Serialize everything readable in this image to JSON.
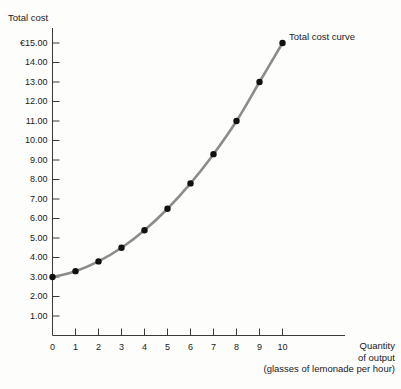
{
  "chart_data": {
    "type": "line",
    "title": "",
    "subtitle": "",
    "ylabel": "Total cost",
    "xlabel": "Quantity of output (glasses of lemonade per hour)",
    "xlabel_lines": [
      "Quantity",
      "of output",
      "(glasses of lemonade per hour)"
    ],
    "currency_symbol": "€",
    "x": [
      0,
      1,
      2,
      3,
      4,
      5,
      6,
      7,
      8,
      9,
      10
    ],
    "xlim": [
      0,
      10.6
    ],
    "ylim": [
      0,
      15.6
    ],
    "grid": false,
    "legend_position": "inline-right-of-last-point",
    "series": [
      {
        "name": "Total cost curve",
        "color": "#8c8c8c",
        "marker_color": "#111111",
        "values": [
          3.0,
          3.3,
          3.8,
          4.5,
          5.4,
          6.5,
          7.8,
          9.3,
          11.0,
          13.0,
          15.0
        ]
      }
    ],
    "xticks": [
      0,
      1,
      2,
      3,
      4,
      5,
      6,
      7,
      8,
      9,
      10
    ],
    "xtick_labels": [
      "0",
      "1",
      "2",
      "3",
      "4",
      "5",
      "6",
      "7",
      "8",
      "9",
      "10"
    ],
    "yticks": [
      1,
      2,
      3,
      4,
      5,
      6,
      7,
      8,
      9,
      10,
      11,
      12,
      13,
      14,
      15
    ],
    "ytick_labels": [
      "1.00",
      "2.00",
      "3.00",
      "4.00",
      "5.00",
      "6.00",
      "7.00",
      "8.00",
      "9.00",
      "10.00",
      "11.00",
      "12.00",
      "13.00",
      "14.00",
      "€15.00"
    ],
    "annotations": [
      {
        "text": "Total cost curve",
        "x": 10,
        "y": 15.0
      }
    ]
  },
  "axes": {
    "y_title": "Total cost",
    "x_title_line1": "Quantity",
    "x_title_line2": "of output",
    "x_title_line3": "(glasses of lemonade per hour)"
  },
  "series_label": "Total cost curve",
  "colors": {
    "curve": "#8c8c8c",
    "marker": "#111111",
    "axis": "#3a3a3a",
    "text": "#1a1a1a",
    "background": "#fdfdfc"
  }
}
